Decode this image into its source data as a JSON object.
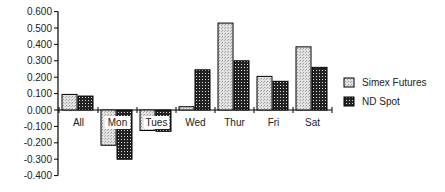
{
  "chart_data": {
    "type": "bar",
    "title": "",
    "xlabel": "",
    "ylabel": "",
    "categories": [
      "All",
      "Mon",
      "Tues",
      "Wed",
      "Thur",
      "Fri",
      "Sat"
    ],
    "series": [
      {
        "name": "Simex Futures",
        "values": [
          0.095,
          -0.215,
          -0.125,
          0.02,
          0.53,
          0.205,
          0.385
        ]
      },
      {
        "name": "ND Spot",
        "values": [
          0.085,
          -0.3,
          -0.13,
          0.245,
          0.3,
          0.175,
          0.26
        ]
      }
    ],
    "ylim": [
      -0.4,
      0.6
    ],
    "yticks": [
      "0.600",
      "0.500",
      "0.400",
      "0.300",
      "0.200",
      "0.100",
      "0.000",
      "-0.100",
      "-0.200",
      "-0.300",
      "-0.400"
    ],
    "grid": false,
    "legend_position": "right"
  },
  "legend": {
    "items": [
      {
        "label": "Simex Futures",
        "color": "#d0d0d0"
      },
      {
        "label": "ND Spot",
        "color": "#404040"
      }
    ]
  }
}
